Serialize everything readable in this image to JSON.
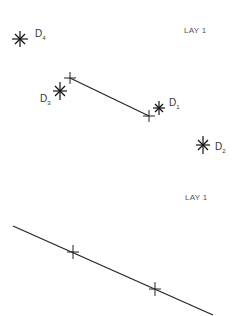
{
  "colors": {
    "background": "#ffffff",
    "ink": "#222222",
    "label": "#333333"
  },
  "top_panel": {
    "layer_label": "LAY 1",
    "segment": {
      "start": [
        70,
        78
      ],
      "end": [
        149,
        116
      ]
    },
    "points": [
      {
        "id": "D1",
        "letter": "D",
        "sub": "1",
        "pos": [
          159,
          108
        ],
        "label_pos": [
          169,
          104
        ]
      },
      {
        "id": "D2",
        "letter": "D",
        "sub": "2",
        "pos": [
          203,
          145
        ],
        "label_pos": [
          215,
          150
        ]
      },
      {
        "id": "D3",
        "letter": "D",
        "sub": "3",
        "pos": [
          60,
          91
        ],
        "label_pos": [
          40,
          103
        ]
      },
      {
        "id": "D4",
        "letter": "D",
        "sub": "4",
        "pos": [
          20,
          39
        ],
        "label_pos": [
          35,
          37
        ]
      }
    ]
  },
  "bottom_panel": {
    "layer_label": "LAY 1",
    "line": {
      "start": [
        13,
        226
      ],
      "end": [
        213,
        315
      ]
    },
    "crosses": [
      [
        73,
        252
      ],
      [
        155,
        289
      ]
    ]
  }
}
